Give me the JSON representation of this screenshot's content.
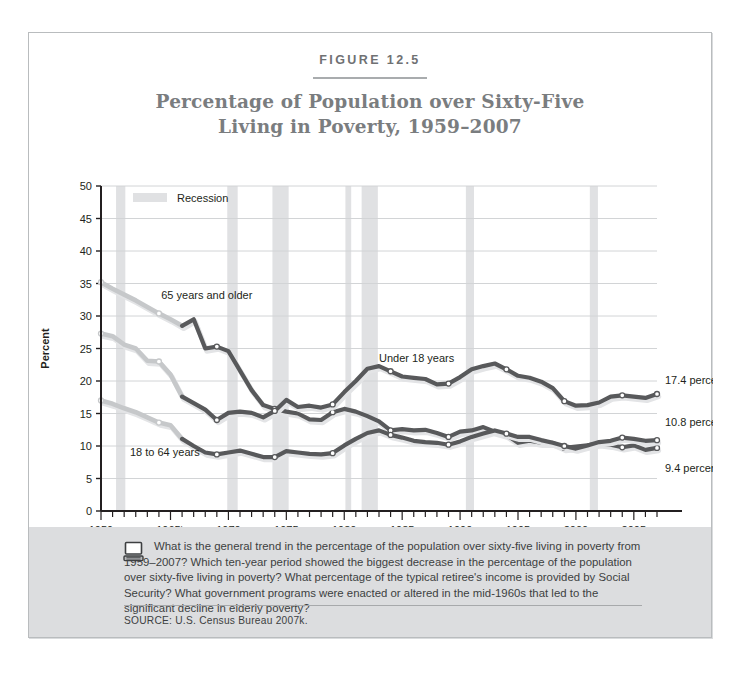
{
  "figure": {
    "number_label": "FIGURE 12.5",
    "title_line1": "Percentage of Population over Sixty-Five",
    "title_line2": "Living in Poverty, 1959–2007"
  },
  "footer": {
    "question": "What is the general trend in the percentage of the population over sixty-five living in poverty from 1959–2007? Which ten-year period showed the biggest decrease in the percentage of the population over sixty-five living in poverty? What percentage of the typical retiree's income is provided by Social Security? What government programs were enacted or altered in the mid-1960s that led to the significant decline in elderly poverty?",
    "source": "SOURCE:  U.S. Census Bureau 2007k.",
    "icon": "computer-monitor-icon"
  },
  "colors": {
    "line_dark": "#58595b",
    "line_light": "#c6c8ca",
    "recession_band": "#e0e1e3",
    "grid": "#d2d4d6",
    "axis": "#231f20",
    "footer_band": "#dcdddf",
    "title_text": "#7a7d7f",
    "card_border": "#b9bcbe"
  },
  "chart_data": {
    "type": "line",
    "title": "Percentage of Population over Sixty-Five Living in Poverty, 1959–2007",
    "xlabel": "Year",
    "ylabel": "Percent",
    "xlim": [
      1959,
      2007
    ],
    "ylim": [
      0,
      50
    ],
    "yticks": [
      0,
      5,
      10,
      15,
      20,
      25,
      30,
      35,
      40,
      45,
      50
    ],
    "ytick_labels": [
      "0",
      "5",
      "10",
      "15",
      "20",
      "25",
      "30",
      "35",
      "40",
      "45",
      "50"
    ],
    "xtick_labels": [
      "1959",
      "1965ᵇ",
      "1970",
      "1975",
      "1980",
      "1985",
      "1990",
      "1995",
      "2000",
      "2005"
    ],
    "xtick_values": [
      1959,
      1965,
      1970,
      1975,
      1980,
      1985,
      1990,
      1995,
      2000,
      2005
    ],
    "minor_tick_interval": 1,
    "grid": "horizontal",
    "legend": {
      "position": "top-left-inside",
      "entries": [
        {
          "label": "Recession",
          "swatch": "#e0e1e3"
        }
      ]
    },
    "series": [
      {
        "name": "65 years and older",
        "label": "65 years and older",
        "label_x": 1964.2,
        "label_y": 32.6,
        "end_annotation": "9.4 percent",
        "x": [
          1959,
          1960,
          1961,
          1962,
          1963,
          1964,
          1965,
          1966,
          1967,
          1968,
          1969,
          1970,
          1971,
          1972,
          1973,
          1974,
          1975,
          1976,
          1977,
          1978,
          1979,
          1980,
          1981,
          1982,
          1983,
          1984,
          1985,
          1986,
          1987,
          1988,
          1989,
          1990,
          1991,
          1992,
          1993,
          1994,
          1995,
          1996,
          1997,
          1998,
          1999,
          2000,
          2001,
          2002,
          2003,
          2004,
          2005,
          2006,
          2007
        ],
        "y": [
          35.2,
          34.2,
          33.3,
          32.4,
          31.4,
          30.4,
          29.5,
          28.5,
          29.5,
          25.0,
          25.3,
          24.6,
          21.6,
          18.6,
          16.3,
          15.7,
          15.3,
          15.0,
          14.1,
          14.0,
          15.2,
          15.7,
          15.3,
          14.6,
          13.8,
          12.4,
          12.6,
          12.4,
          12.5,
          12.0,
          11.4,
          12.2,
          12.4,
          12.9,
          12.2,
          11.7,
          10.5,
          10.8,
          10.5,
          10.5,
          9.7,
          9.9,
          10.1,
          10.4,
          10.2,
          9.8,
          10.1,
          9.4,
          9.7
        ]
      },
      {
        "name": "Under 18 years",
        "label": "Under 18 years",
        "label_x": 1983.0,
        "label_y": 23.0,
        "end_annotation": "17.4 percent",
        "x": [
          1959,
          1960,
          1961,
          1962,
          1963,
          1964,
          1965,
          1966,
          1967,
          1968,
          1969,
          1970,
          1971,
          1972,
          1973,
          1974,
          1975,
          1976,
          1977,
          1978,
          1979,
          1980,
          1981,
          1982,
          1983,
          1984,
          1985,
          1986,
          1987,
          1988,
          1989,
          1990,
          1991,
          1992,
          1993,
          1994,
          1995,
          1996,
          1997,
          1998,
          1999,
          2000,
          2001,
          2002,
          2003,
          2004,
          2005,
          2006,
          2007
        ],
        "y": [
          27.3,
          26.9,
          25.6,
          25.0,
          23.1,
          23.0,
          21.0,
          17.6,
          16.6,
          15.6,
          14.0,
          15.1,
          15.3,
          15.1,
          14.4,
          15.4,
          17.1,
          16.0,
          16.2,
          15.9,
          16.4,
          18.3,
          20.0,
          21.9,
          22.3,
          21.5,
          20.7,
          20.5,
          20.3,
          19.5,
          19.6,
          20.6,
          21.8,
          22.3,
          22.7,
          21.8,
          20.8,
          20.5,
          19.9,
          18.9,
          16.9,
          16.2,
          16.3,
          16.7,
          17.6,
          17.8,
          17.6,
          17.4,
          18.0
        ]
      },
      {
        "name": "18 to 64 years",
        "label": "18 to 64 years",
        "label_x": 1961.5,
        "label_y": 8.4,
        "end_annotation": "10.8 percent",
        "x": [
          1959,
          1960,
          1961,
          1962,
          1963,
          1964,
          1965,
          1966,
          1967,
          1968,
          1969,
          1970,
          1971,
          1972,
          1973,
          1974,
          1975,
          1976,
          1977,
          1978,
          1979,
          1980,
          1981,
          1982,
          1983,
          1984,
          1985,
          1986,
          1987,
          1988,
          1989,
          1990,
          1991,
          1992,
          1993,
          1994,
          1995,
          1996,
          1997,
          1998,
          1999,
          2000,
          2001,
          2002,
          2003,
          2004,
          2005,
          2006,
          2007
        ],
        "y": [
          17.0,
          16.5,
          15.8,
          15.2,
          14.4,
          13.6,
          13.2,
          11.1,
          10.0,
          9.0,
          8.7,
          9.0,
          9.3,
          8.8,
          8.3,
          8.3,
          9.2,
          9.0,
          8.8,
          8.7,
          8.9,
          10.1,
          11.1,
          12.0,
          12.4,
          11.7,
          11.3,
          10.8,
          10.6,
          10.5,
          10.2,
          10.7,
          11.4,
          11.9,
          12.4,
          11.9,
          11.4,
          11.4,
          10.9,
          10.5,
          10.0,
          9.6,
          10.1,
          10.6,
          10.8,
          11.3,
          11.1,
          10.8,
          10.9
        ]
      }
    ],
    "markers_every": 5,
    "light_segment_until": 1966,
    "recession_bands": [
      {
        "start": 1960.3,
        "end": 1961.1
      },
      {
        "start": 1969.9,
        "end": 1970.8
      },
      {
        "start": 1973.8,
        "end": 1975.2
      },
      {
        "start": 1980.1,
        "end": 1980.6
      },
      {
        "start": 1981.5,
        "end": 1982.9
      },
      {
        "start": 1990.5,
        "end": 1991.2
      },
      {
        "start": 2001.2,
        "end": 2001.9
      }
    ]
  }
}
